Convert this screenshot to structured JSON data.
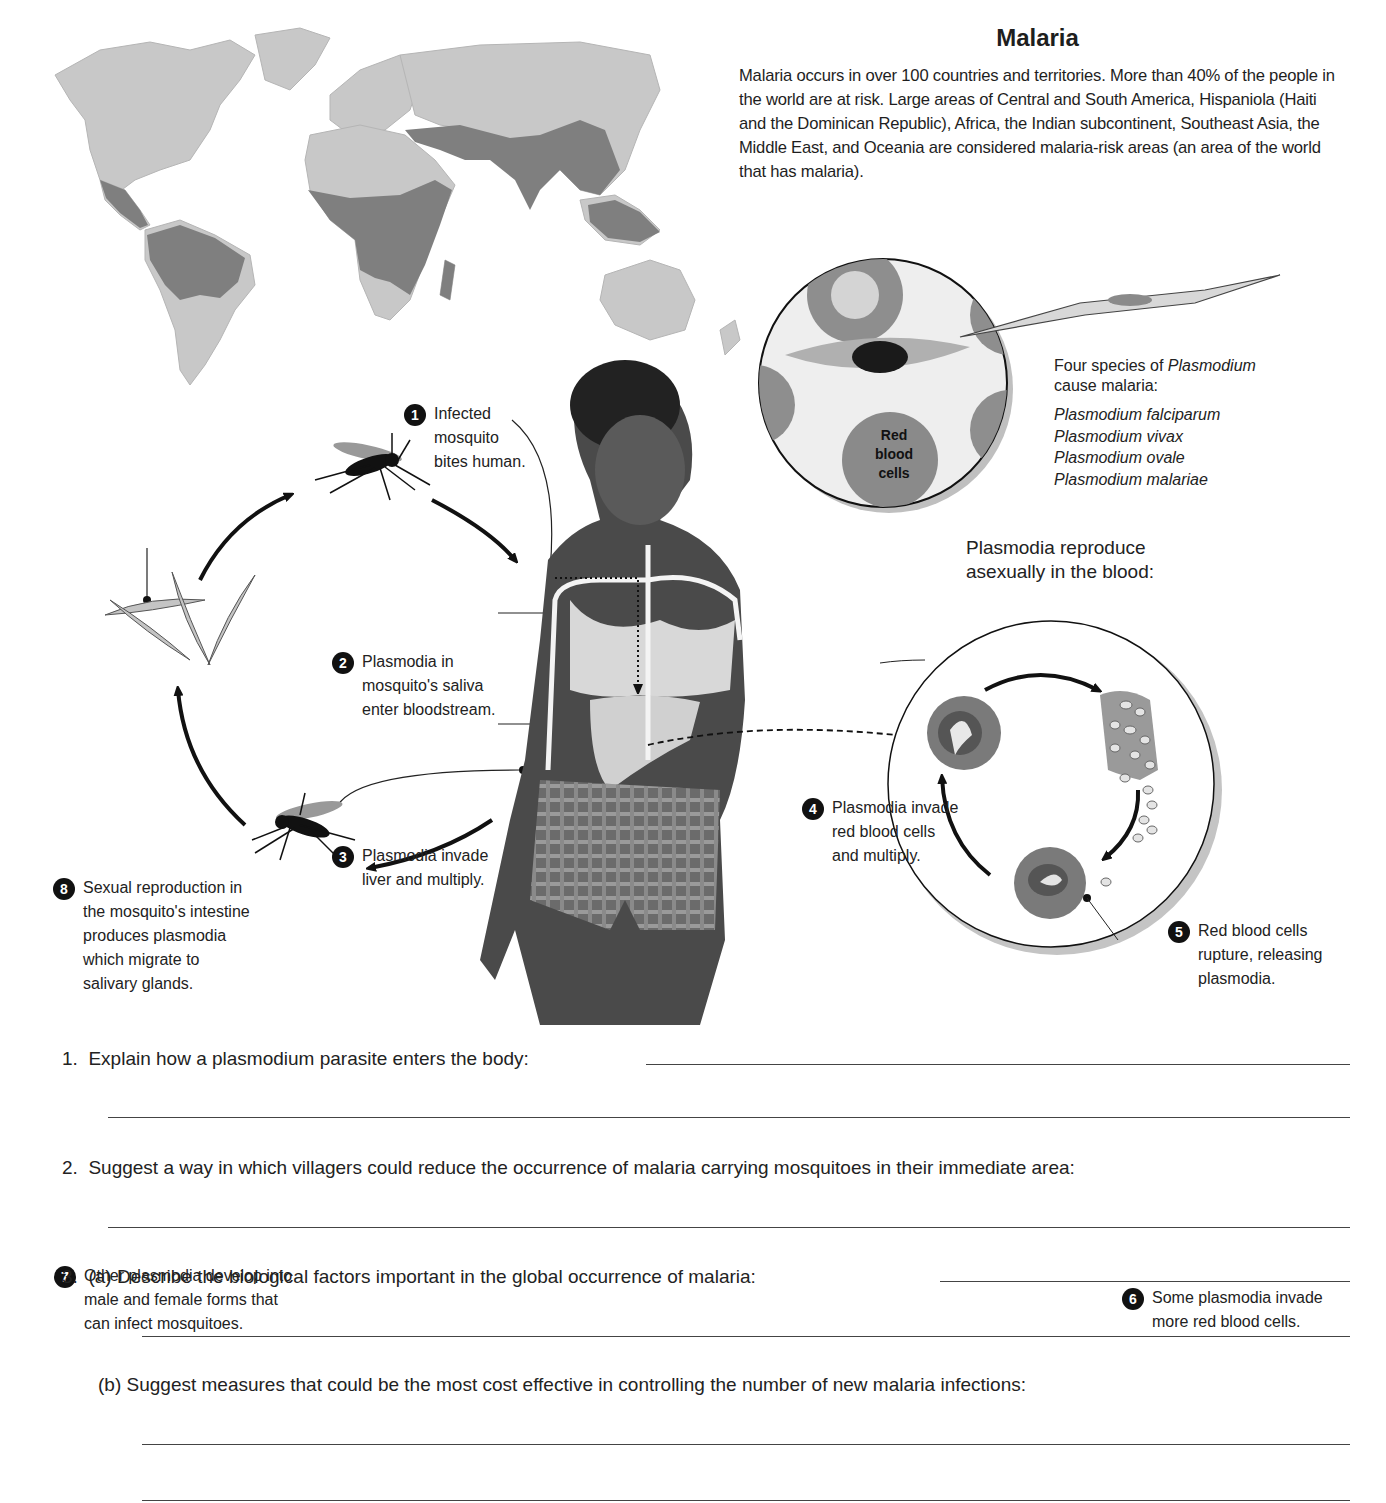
{
  "header": {
    "title": "Malaria",
    "intro": "Malaria occurs in over 100 countries and territories. More than 40% of the people in the world are at risk. Large areas of Central and South America, Hispaniola (Haiti and the Dominican Republic), Africa, the Indian subcontinent, Southeast Asia, the Middle East, and Oceania are considered malaria-risk areas (an area of the world that has malaria)."
  },
  "colors": {
    "map_land": "#c8c8c8",
    "map_risk": "#7f7f7f",
    "ink": "#1e1e1e",
    "rbc": "#8a8a8a",
    "blood_circle_bg": "#e6e6e6"
  },
  "map": {
    "icon": "world-map-malaria-risk",
    "legend_risk": "malaria-risk areas"
  },
  "species": {
    "heading_prefix": "Four species of ",
    "heading_italic": "Plasmodium",
    "heading_suffix": "cause malaria:",
    "list": [
      "Plasmodium falciparum",
      "Plasmodium vivax",
      "Plasmodium ovale",
      "Plasmodium malariae"
    ],
    "rbc_label": [
      "Red",
      "blood",
      "cells"
    ]
  },
  "asexual": {
    "heading": [
      "Plasmodia reproduce",
      "asexually in the blood:"
    ]
  },
  "steps": [
    {
      "n": "1",
      "lines": [
        "Infected",
        "mosquito",
        "bites human."
      ]
    },
    {
      "n": "2",
      "lines": [
        "Plasmodia in",
        "mosquito's saliva",
        "enter bloodstream."
      ]
    },
    {
      "n": "3",
      "lines": [
        "Plasmodia invade",
        "liver and multiply."
      ]
    },
    {
      "n": "4",
      "lines": [
        "Plasmodia invade",
        "red blood cells",
        "and multiply."
      ]
    },
    {
      "n": "5",
      "lines": [
        "Red blood cells",
        "rupture, releasing",
        "plasmodia."
      ]
    },
    {
      "n": "6",
      "lines": [
        "Some plasmodia invade",
        "more red blood cells."
      ]
    },
    {
      "n": "7",
      "lines": [
        "Other plasmodia develop into",
        "male and female forms that",
        "can infect mosquitoes."
      ]
    },
    {
      "n": "8",
      "lines": [
        "Sexual reproduction in",
        "the mosquito's intestine",
        "produces plasmodia",
        "which migrate to",
        "salivary glands."
      ]
    }
  ],
  "questions": [
    {
      "num": "1.",
      "text": "Explain how a plasmodium parasite enters the body:"
    },
    {
      "num": "2.",
      "text": "Suggest a way in which villagers could reduce the occurrence of malaria carrying mosquitoes in their immediate area:"
    },
    {
      "num": "3.",
      "part": "(a)",
      "text": "Describe the biological factors important in the global occurrence of malaria:"
    },
    {
      "part": "(b)",
      "text": "Suggest measures that could be the most cost effective in controlling the number of new malaria infections:"
    }
  ]
}
